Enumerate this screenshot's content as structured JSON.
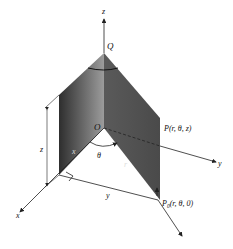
{
  "diagram": {
    "axes": {
      "x_label": "x",
      "y_label": "y",
      "z_label": "z"
    },
    "points": {
      "Q": "Q",
      "O": "O",
      "P": "P(r,  θ, z)",
      "P0_main": "P",
      "P0_sub": "0",
      "P0_rest": "(r,  θ, 0)"
    },
    "labels": {
      "theta": "θ",
      "r": "r",
      "x_seg": "x",
      "y_seg": "y",
      "z_height": "z"
    },
    "colors": {
      "panel_dark": "#3a3a3a",
      "panel_light": "#9a9a9a",
      "line": "#222222"
    }
  }
}
